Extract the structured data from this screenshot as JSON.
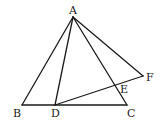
{
  "diagram": {
    "type": "geometry",
    "points": [
      {
        "name": "A",
        "x": 73,
        "y": 17,
        "label_x": 69,
        "label_y": 14
      },
      {
        "name": "B",
        "x": 22,
        "y": 105,
        "label_x": 13,
        "label_y": 117
      },
      {
        "name": "D",
        "x": 55,
        "y": 105,
        "label_x": 51,
        "label_y": 117
      },
      {
        "name": "C",
        "x": 127,
        "y": 105,
        "label_x": 127,
        "label_y": 117
      },
      {
        "name": "F",
        "x": 143,
        "y": 76,
        "label_x": 146,
        "label_y": 81
      },
      {
        "name": "E",
        "x": 116,
        "y": 87,
        "label_x": 120,
        "label_y": 93
      }
    ],
    "segments": [
      {
        "from": "A",
        "to": "B"
      },
      {
        "from": "A",
        "to": "D"
      },
      {
        "from": "A",
        "to": "C"
      },
      {
        "from": "A",
        "to": "F"
      },
      {
        "from": "B",
        "to": "C"
      },
      {
        "from": "D",
        "to": "F"
      }
    ]
  }
}
